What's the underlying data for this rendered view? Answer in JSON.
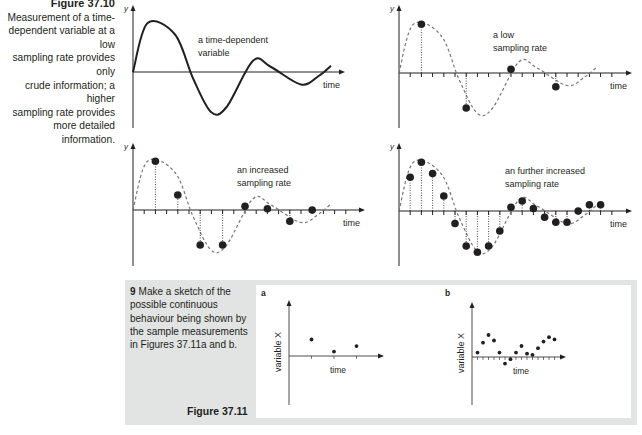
{
  "figure_37_10": {
    "title": "Figure 37.10",
    "caption": "Measurement of a time-dependent variable at a low sampling rate provides only crude information; a higher sampling rate provides more detailed information.",
    "caption_lines": [
      "Measurement of a time-",
      "dependent variable at a low",
      "sampling rate provides only",
      "crude information; a higher",
      "sampling rate provides",
      "more detailed information."
    ]
  },
  "figure_37_11": {
    "title": "Figure 37.11",
    "question_number": "9",
    "question_text": "Make a sketch of the possible continuous behaviour being shown by the sample measurements in Figures 37.11a and b."
  },
  "chart_data": [
    {
      "type": "line",
      "panel": "top-left",
      "title": "a time-dependent variable",
      "annotation_lines": [
        "a time-dependent",
        "variable"
      ],
      "xlabel": "time",
      "ylabel": "y",
      "description": "damped oscillation (continuous curve)",
      "curve": [
        [
          0,
          0
        ],
        [
          12,
          39
        ],
        [
          35,
          30
        ],
        [
          50,
          -5
        ],
        [
          65,
          -32
        ],
        [
          78,
          -28
        ],
        [
          100,
          9
        ],
        [
          115,
          4
        ],
        [
          140,
          -10
        ],
        [
          155,
          -3
        ],
        [
          165,
          5
        ]
      ]
    },
    {
      "type": "scatter",
      "panel": "top-right",
      "title": "a low sampling rate",
      "annotation_lines": [
        "a low",
        "sampling rate"
      ],
      "xlabel": "time",
      "ylabel": "y",
      "sample_interval_ticks": 4,
      "samples_x": [
        2,
        6,
        10,
        14
      ],
      "samples_y": [
        39,
        -28,
        3,
        -11
      ]
    },
    {
      "type": "scatter",
      "panel": "bottom-left",
      "title": "an increased sampling rate",
      "annotation_lines": [
        "an increased",
        "sampling rate"
      ],
      "xlabel": "time",
      "ylabel": "y",
      "sample_interval_ticks": 2,
      "samples_x": [
        2,
        4,
        6,
        8,
        10,
        12,
        14,
        16
      ],
      "samples_y": [
        39,
        12,
        -28,
        -28,
        3,
        1,
        -9,
        0
      ]
    },
    {
      "type": "scatter",
      "panel": "bottom-right",
      "title": "an further increased sampling rate",
      "annotation_lines": [
        "an further increased",
        "sampling rate"
      ],
      "xlabel": "time",
      "ylabel": "y",
      "sample_interval_ticks": 1,
      "samples_x": [
        1,
        2,
        3,
        4,
        5,
        6,
        7,
        8,
        9,
        10,
        11,
        12,
        13,
        14,
        15,
        16,
        17,
        18
      ],
      "samples_y": [
        27,
        39,
        30,
        12,
        -10,
        -28,
        -33,
        -28,
        -16,
        3,
        8,
        2,
        -5,
        -9,
        -9,
        0,
        5,
        5
      ]
    },
    {
      "type": "scatter",
      "panel": "fig-37-11a",
      "label": "a",
      "xlabel": "time",
      "ylabel": "variable X",
      "x": [
        1,
        2,
        3
      ],
      "y": [
        15,
        4,
        9
      ]
    },
    {
      "type": "scatter",
      "panel": "fig-37-11b",
      "label": "b",
      "xlabel": "time",
      "ylabel": "variable X",
      "x": [
        1,
        2,
        3,
        4,
        5,
        6,
        7,
        8,
        9,
        10,
        11,
        12,
        13,
        14,
        15
      ],
      "y": [
        4,
        13,
        20,
        15,
        4,
        -6,
        -2,
        4,
        10,
        3,
        2,
        8,
        14,
        18,
        16
      ]
    }
  ]
}
